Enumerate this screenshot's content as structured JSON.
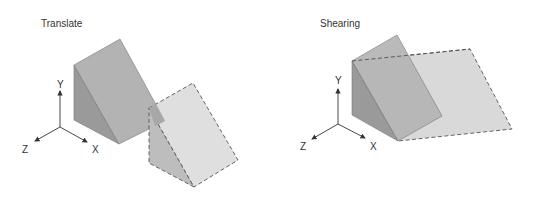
{
  "panels": [
    {
      "id": "translate",
      "title": "Translate",
      "axes": {
        "y": "Y",
        "z": "Z",
        "x": "X"
      }
    },
    {
      "id": "shearing",
      "title": "Shearing",
      "axes": {
        "y": "Y",
        "z": "Z",
        "x": "X"
      }
    }
  ],
  "colors": {
    "slope_face": "#b3b3b3",
    "side_face": "#999999",
    "ghost_face": "#d9d9d9",
    "ghost_side": "#bdbdbd",
    "edge": "#555555",
    "axis": "#333333"
  }
}
